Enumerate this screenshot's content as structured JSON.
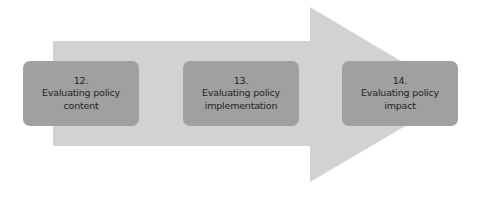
{
  "diagram": {
    "arrow_color": "#d2d2d2",
    "box_color": "#a0a0a0",
    "steps": [
      {
        "number": "12.",
        "line1": "Evaluating policy",
        "line2": "content"
      },
      {
        "number": "13.",
        "line1": "Evaluating policy",
        "line2": "implementation"
      },
      {
        "number": "14.",
        "line1": "Evaluating policy",
        "line2": "impact"
      }
    ]
  }
}
